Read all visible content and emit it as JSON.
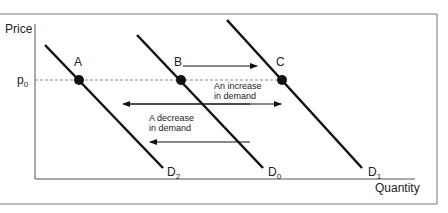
{
  "diagram": {
    "axes": {
      "y_label": "Price",
      "x_label": "Quantity",
      "price_level_label": "p",
      "price_level_sub": "0"
    },
    "curves": [
      {
        "name": "D",
        "sub": "2",
        "role": "decreased demand"
      },
      {
        "name": "D",
        "sub": "0",
        "role": "original demand"
      },
      {
        "name": "D",
        "sub": "1",
        "role": "increased demand"
      }
    ],
    "points": [
      {
        "label": "A",
        "curve": "D2"
      },
      {
        "label": "B",
        "curve": "D0"
      },
      {
        "label": "C",
        "curve": "D1"
      }
    ],
    "annotations": {
      "increase_line1": "An increase",
      "increase_line2": "in demand",
      "decrease_line1": "A decrease",
      "decrease_line2": "in demand"
    },
    "colors": {
      "line": "#111111",
      "frame": "#777777",
      "dashed": "#888888"
    }
  }
}
